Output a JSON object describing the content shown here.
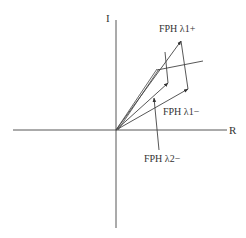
{
  "diagram": {
    "type": "phasor-diagram",
    "axes": {
      "vertical_label": "I",
      "horizontal_label": "R"
    },
    "labels": {
      "lambda1_plus": "FPH λ1+",
      "lambda1_minus": "FPH λ1−",
      "lambda2_minus": "FPH λ2−"
    },
    "colors": {
      "line": "#444444",
      "text": "#333333",
      "background": "#ffffff"
    }
  }
}
